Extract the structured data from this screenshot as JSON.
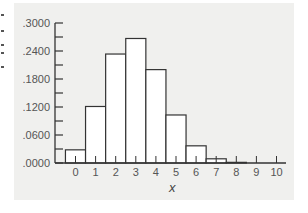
{
  "chart_data": {
    "type": "bar",
    "title": "",
    "xlabel": "x",
    "ylabel": "",
    "categories": [
      "0",
      "1",
      "2",
      "3",
      "4",
      "5",
      "6",
      "7",
      "8",
      "9",
      "10"
    ],
    "values": [
      0.0282,
      0.1211,
      0.2335,
      0.2668,
      0.2001,
      0.1029,
      0.0368,
      0.009,
      0.0014,
      0.0001,
      0.0
    ],
    "ylim": [
      0,
      0.3
    ],
    "yticks": [
      ".0000",
      ".0600",
      ".1200",
      ".1800",
      ".2400",
      ".3000"
    ],
    "ytick_values": [
      0,
      0.06,
      0.12,
      0.18,
      0.24,
      0.3
    ],
    "minor_tick_step": 0.03,
    "grid": false,
    "legend": null,
    "bar_fill": "#ffffff",
    "bar_stroke": "#333333",
    "panel_background": "#f0f0ee"
  }
}
